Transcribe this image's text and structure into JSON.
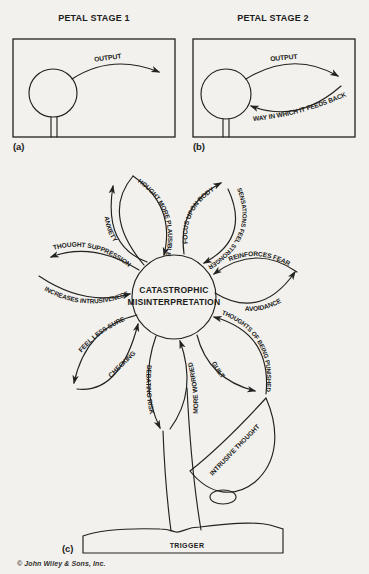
{
  "page": {
    "background_color": "#f2f1ed",
    "ink_color": "#222220",
    "copyright": "© John Wiley & Sons, Inc."
  },
  "panel_a": {
    "title": "PETAL STAGE 1",
    "caption": "(a)",
    "output_label": "OUTPUT"
  },
  "panel_b": {
    "title": "PETAL STAGE 2",
    "caption": "(b)",
    "output_label": "OUTPUT",
    "feedback_label": "WAY IN WHICH IT FEEDS BACK"
  },
  "flower": {
    "caption": "(c)",
    "center_line1": "CATASTROPHIC",
    "center_line2": "MISINTERPRETATION",
    "labels": {
      "anxiety": "ANXIETY",
      "thought_more_plausible": "THOUGHT MORE PLAUSIBLE",
      "focus_upon_body": "FOCUS UPON BODY",
      "sensations_feel_stronger": "SENSATIONS FEEL STRONGER",
      "reinforces_fear": "REINFORCES FEAR",
      "avoidance": "AVOIDANCE",
      "thoughts_of_being_punished": "THOUGHTS OF BEING PUNISHED",
      "guilt": "GUILT",
      "more_worried": "MORE WORRIED",
      "debating_risk": "DEBATING RISK",
      "checking": "CHECKING",
      "feel_less_sure": "FEEL LESS SURE",
      "thought_suppression": "THOUGHT SUPPRESSION",
      "increases_intrusiveness": "INCREASES INTRUSIVENESS",
      "intrusive_thought": "INTRUSIVE THOUGHT",
      "trigger": "TRIGGER"
    }
  }
}
